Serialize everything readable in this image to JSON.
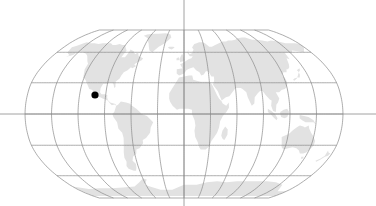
{
  "figure": {
    "name": "world-map-locator",
    "type": "map",
    "projection": "robinson",
    "width": 376,
    "height": 206,
    "background_color": "#ffffff"
  },
  "map": {
    "land_color": "#e2e2e2",
    "outline_color": "#8a8a8a",
    "graticule_color": "#8a8a8a",
    "graticule_width": 0.7,
    "axis_color": "#8a8a8a",
    "axis_width": 0.8,
    "bounds": {
      "left": 30,
      "right": 348,
      "top": 30,
      "bottom": 198
    },
    "center": {
      "x": 184,
      "y": 114
    },
    "graticule": {
      "meridian_step_deg": 30,
      "parallel_step_deg": 30,
      "meridians_deg": [
        -180,
        -150,
        -120,
        -90,
        -60,
        -30,
        0,
        30,
        60,
        90,
        120,
        150,
        180
      ],
      "parallels_deg": [
        -60,
        -30,
        0,
        30,
        60
      ],
      "lon_range": [
        -180,
        180
      ],
      "lat_range": [
        -90,
        90
      ]
    },
    "crosshair": {
      "vertical_meridian_deg": 0,
      "horizontal_parallel_deg": 0,
      "vertical_full_height": true,
      "horizontal_full_width": true
    }
  },
  "marker": {
    "name": "location-marker",
    "color": "#000000",
    "radius_px": 3.6,
    "x_px": 95,
    "y_px": 95,
    "lon_deg": -82,
    "lat_deg": 25
  },
  "chart_data": {
    "type": "map",
    "title": "",
    "projection": "robinson",
    "series": [
      {
        "name": "location-marker",
        "values": [
          {
            "lon": -82,
            "lat": 25
          }
        ],
        "color": "#000000",
        "marker": "circle",
        "size": 7
      }
    ],
    "xlabel": "",
    "ylabel": "",
    "xlim": [
      -180,
      180
    ],
    "ylim": [
      -90,
      90
    ],
    "grid": true,
    "legend": null
  }
}
